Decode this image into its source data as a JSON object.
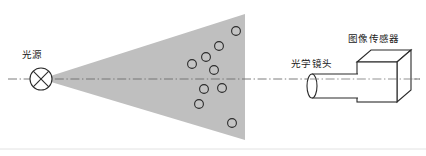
{
  "diagram": {
    "background_color": "#ffffff",
    "width": 426,
    "height": 156,
    "beam": {
      "name": "light-beam-cone",
      "fill_color": "#bfbfbf",
      "apex_x": 41,
      "apex_y": 79,
      "right_edge_x": 245,
      "top_y": 14,
      "bottom_y": 140
    },
    "optical_axis": {
      "name": "optical-axis",
      "color": "#6e6e6e",
      "style": "dash-dot",
      "y": 79,
      "x_start": 8,
      "x_end": 420
    },
    "bottom_rule": {
      "color": "#e2e2e2",
      "y": 149
    }
  },
  "light_source": {
    "label": "光源",
    "label_x": 22,
    "label_y": 58,
    "symbol": "circle-with-x",
    "center_x": 41,
    "center_y": 79,
    "radius": 11,
    "stroke_color": "#2b2b2b"
  },
  "optical_lens": {
    "label": "光学镜头",
    "label_x": 291,
    "label_y": 67,
    "shape": "cylinder",
    "stroke_color": "#2b2b2b",
    "fill_color": "#ffffff",
    "left_x": 312,
    "right_x": 358,
    "center_y": 86,
    "radius_y": 12,
    "radius_x": 5
  },
  "image_sensor": {
    "label": "图像传感器",
    "label_x": 348,
    "label_y": 42,
    "shape": "cube-oblique",
    "stroke_color": "#2b2b2b",
    "fill_color": "#ffffff",
    "front_left_x": 357,
    "front_top_y": 62,
    "front_size": 40,
    "depth_dx": 14,
    "depth_dy": -12
  },
  "particles": {
    "name": "scattering-particles",
    "stroke_color": "#2b2b2b",
    "fill_color": "#c4c4c4",
    "radius": 4.4,
    "count": 9,
    "points": [
      {
        "x": 219,
        "y": 46
      },
      {
        "x": 206,
        "y": 57
      },
      {
        "x": 192,
        "y": 64
      },
      {
        "x": 214,
        "y": 70
      },
      {
        "x": 204,
        "y": 89
      },
      {
        "x": 222,
        "y": 88
      },
      {
        "x": 199,
        "y": 104
      },
      {
        "x": 232,
        "y": 123
      },
      {
        "x": 236,
        "y": 31
      }
    ]
  }
}
